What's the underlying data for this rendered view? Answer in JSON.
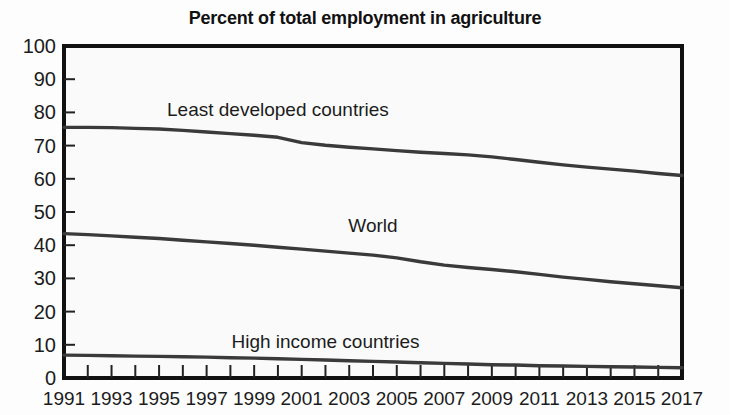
{
  "chart_data": {
    "type": "line",
    "title": "Percent of total employment in agriculture",
    "xlabel": "",
    "ylabel": "",
    "xlim": [
      1991,
      2017
    ],
    "ylim": [
      0,
      100
    ],
    "yticks": [
      0,
      10,
      20,
      30,
      40,
      50,
      60,
      70,
      80,
      90,
      100
    ],
    "xticks": [
      1991,
      1993,
      1995,
      1997,
      1999,
      2001,
      2003,
      2005,
      2007,
      2009,
      2011,
      2013,
      2015,
      2017
    ],
    "x": [
      1991,
      1992,
      1993,
      1994,
      1995,
      1996,
      1997,
      1998,
      1999,
      2000,
      2001,
      2002,
      2003,
      2004,
      2005,
      2006,
      2007,
      2008,
      2009,
      2010,
      2011,
      2012,
      2013,
      2014,
      2015,
      2016,
      2017
    ],
    "grid": false,
    "legend_position": "inline-annotations",
    "series": [
      {
        "name": "Least developed countries",
        "label_x": 2000,
        "label_y": 79,
        "values": [
          75.5,
          75.5,
          75.4,
          75.2,
          75.0,
          74.6,
          74.1,
          73.6,
          73.1,
          72.5,
          70.9,
          70.1,
          69.5,
          69.0,
          68.5,
          68.0,
          67.6,
          67.2,
          66.6,
          65.8,
          65.0,
          64.2,
          63.5,
          62.9,
          62.3,
          61.6,
          61.0
        ]
      },
      {
        "name": "World",
        "label_x": 2004,
        "label_y": 44,
        "values": [
          43.5,
          43.2,
          42.8,
          42.4,
          42.0,
          41.5,
          41.0,
          40.5,
          40.0,
          39.4,
          38.8,
          38.2,
          37.6,
          37.0,
          36.2,
          35.0,
          34.0,
          33.3,
          32.7,
          32.0,
          31.2,
          30.4,
          29.7,
          29.0,
          28.4,
          27.8,
          27.2
        ]
      },
      {
        "name": "High income countries",
        "label_x": 2002,
        "label_y": 9,
        "values": [
          6.9,
          6.8,
          6.7,
          6.6,
          6.5,
          6.4,
          6.3,
          6.1,
          6.0,
          5.8,
          5.6,
          5.4,
          5.2,
          5.0,
          4.8,
          4.6,
          4.4,
          4.2,
          4.0,
          3.9,
          3.7,
          3.6,
          3.5,
          3.4,
          3.3,
          3.2,
          3.1
        ]
      }
    ]
  },
  "colors": {
    "line": "#3a3a3a",
    "axis": "#111111",
    "text": "#1c1c1c",
    "plot_background": "#fafafa",
    "page_background": "#fdfdfd"
  }
}
